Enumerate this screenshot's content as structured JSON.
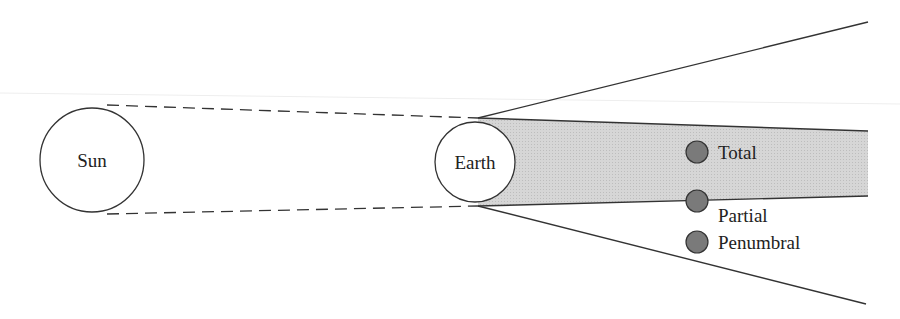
{
  "diagram": {
    "type": "lunar-eclipse-geometry",
    "bodies": {
      "sun": {
        "label": "Sun"
      },
      "earth": {
        "label": "Earth"
      }
    },
    "moon_positions": [
      {
        "label": "Total"
      },
      {
        "label": "Partial"
      },
      {
        "label": "Penumbral"
      }
    ],
    "colors": {
      "umbra_fill": "#d9d9d9",
      "moon_fill": "#7a7a7a",
      "line": "#333333",
      "background": "#ffffff"
    }
  }
}
